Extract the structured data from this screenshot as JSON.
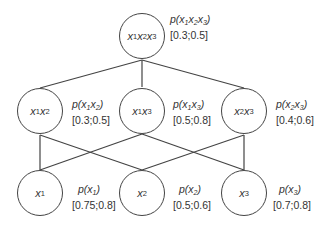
{
  "diagram": {
    "type": "lattice",
    "nodes": [
      {
        "id": "x1x2x3",
        "vars": [
          "x",
          "1",
          "x",
          "2",
          "x",
          "3"
        ],
        "prob_label": "p(x1x2x3)",
        "interval": "[0.3;0.5]",
        "level": 0
      },
      {
        "id": "x1x2",
        "prob_label": "p(x1x2)",
        "interval": "[0.3;0.5]",
        "level": 1
      },
      {
        "id": "x1x3",
        "prob_label": "p(x1x3)",
        "interval": "[0.5;0.8]",
        "level": 1
      },
      {
        "id": "x2x3",
        "prob_label": "p(x2x3)",
        "interval": "[0.4;0.6]",
        "level": 1
      },
      {
        "id": "x1",
        "prob_label": "p(x1)",
        "interval": "[0.75;0.8]",
        "level": 2
      },
      {
        "id": "x2",
        "prob_label": "p(x2)",
        "interval": "[0.5;0.6]",
        "level": 2
      },
      {
        "id": "x3",
        "prob_label": "p(x3)",
        "interval": "[0.7;0.8]",
        "level": 2
      }
    ],
    "edges": [
      [
        "x1x2x3",
        "x1x2"
      ],
      [
        "x1x2x3",
        "x1x3"
      ],
      [
        "x1x2x3",
        "x2x3"
      ],
      [
        "x1x2",
        "x1"
      ],
      [
        "x1x2",
        "x2"
      ],
      [
        "x1x3",
        "x1"
      ],
      [
        "x1x3",
        "x3"
      ],
      [
        "x2x3",
        "x2"
      ],
      [
        "x2x3",
        "x3"
      ]
    ],
    "intervals": {
      "x1x2x3": "[0.3;0.5]",
      "x1x2": "[0.3;0.5]",
      "x1x3": "[0.5;0.8]",
      "x2x3": "[0.4;0.6]",
      "x1": "[0.75;0.8]",
      "x2": "[0.5;0.6]",
      "x3": "[0.7;0.8]"
    },
    "subscripts": {
      "one": "1",
      "two": "2",
      "three": "3"
    },
    "var_letter": "x",
    "p_prefix": "p(",
    "p_suffix": ")"
  }
}
